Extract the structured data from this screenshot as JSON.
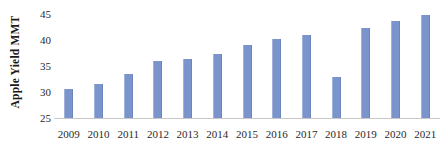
{
  "chart_data": {
    "type": "bar",
    "title": "",
    "subtitle": "",
    "xlabel": "",
    "ylabel": "Apple Yield MMT",
    "categories": [
      "2009",
      "2010",
      "2011",
      "2012",
      "2013",
      "2014",
      "2015",
      "2016",
      "2017",
      "2018",
      "2019",
      "2020",
      "2021"
    ],
    "values": [
      30.6,
      31.6,
      33.5,
      35.9,
      36.3,
      37.3,
      39.0,
      40.2,
      41.0,
      32.8,
      42.3,
      43.7,
      44.8
    ],
    "series": [
      {
        "name": "Apple Yield MMT",
        "values": [
          30.6,
          31.6,
          33.5,
          35.9,
          36.3,
          37.3,
          39.0,
          40.2,
          41.0,
          32.8,
          42.3,
          43.7,
          44.8
        ]
      }
    ],
    "ylim": [
      25,
      45
    ],
    "yticks": [
      25,
      30,
      35,
      40,
      45
    ],
    "ytick_labels": [
      "25",
      "30",
      "35",
      "40",
      "45"
    ],
    "xlim_categories": 13,
    "grid": false,
    "legend": false,
    "legend_position": "none",
    "bar_color": "#7b95cc",
    "axis_color": "#c8c8c8",
    "background_color": "#ffffff",
    "text_color": "#2a2a2a",
    "annotations": [],
    "data_labels": false
  }
}
